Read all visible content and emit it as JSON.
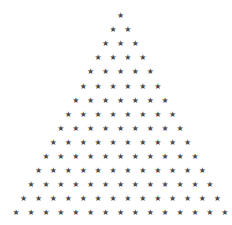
{
  "pattern": {
    "shape": "triangle",
    "glyph": "★",
    "glyph_icon": "star-icon",
    "rows": 15,
    "stars_per_row": [
      1,
      2,
      3,
      4,
      5,
      6,
      7,
      8,
      9,
      10,
      11,
      12,
      13,
      14,
      15
    ],
    "total_stars": 120,
    "color": "#4a4a4a",
    "background": "#ffffff",
    "center_x": 120.5,
    "first_row_y": 16,
    "row_spacing": 14.1,
    "col_spacing": 14.9
  }
}
